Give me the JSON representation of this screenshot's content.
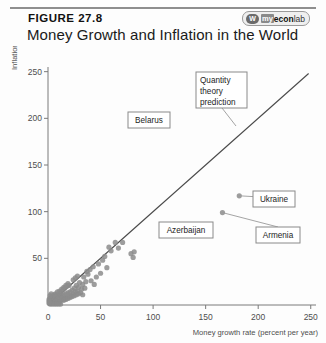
{
  "header": {
    "figure_label": "FIGURE 27.8",
    "title": "Money Growth and Inflation in the World",
    "logo": {
      "mark": "W",
      "part1": "my",
      "part2": "econ",
      "part3": "lab"
    }
  },
  "chart_data": {
    "type": "scatter",
    "title": "Money Growth and Inflation in the World",
    "xlabel": "Money growth rate (percent per year)",
    "ylabel": "Inflation rate (percent per year)",
    "xlim": [
      0,
      255
    ],
    "ylim": [
      0,
      255
    ],
    "xticks": [
      0,
      50,
      100,
      150,
      200,
      250
    ],
    "yticks": [
      50,
      100,
      150,
      200,
      250
    ],
    "grid": false,
    "legend": "none",
    "reference_line": {
      "name": "Quantity theory prediction",
      "slope": 1,
      "intercept": 0,
      "x_from": 0,
      "x_to": 248
    },
    "annotations": [
      {
        "label": "Belarus",
        "x": 96,
        "y": 193
      },
      {
        "label": "Quantity theory prediction",
        "x": 150,
        "y": 150
      },
      {
        "label": "Azerbaijan",
        "x": 117,
        "y": 85
      },
      {
        "label": "Ukraine",
        "x": 182,
        "y": 117
      },
      {
        "label": "Armenia",
        "x": 166,
        "y": 99
      }
    ],
    "points": [
      [
        96,
        193
      ],
      [
        117,
        85
      ],
      [
        182,
        117
      ],
      [
        166,
        99
      ],
      [
        64,
        67
      ],
      [
        71,
        67
      ],
      [
        79,
        55
      ],
      [
        82,
        57
      ],
      [
        81,
        51
      ],
      [
        56,
        40
      ],
      [
        50,
        34
      ],
      [
        46,
        30
      ],
      [
        41,
        26
      ],
      [
        44,
        22
      ],
      [
        36,
        25
      ],
      [
        35,
        18
      ],
      [
        34,
        30
      ],
      [
        33,
        22
      ],
      [
        32,
        17
      ],
      [
        30,
        24
      ],
      [
        29,
        19
      ],
      [
        28,
        15
      ],
      [
        27,
        21
      ],
      [
        26,
        14
      ],
      [
        25,
        18
      ],
      [
        24,
        12
      ],
      [
        23,
        16
      ],
      [
        22,
        10
      ],
      [
        21,
        14
      ],
      [
        20,
        9
      ],
      [
        19,
        13
      ],
      [
        18,
        8
      ],
      [
        17,
        12
      ],
      [
        16,
        7
      ],
      [
        15,
        11
      ],
      [
        14,
        6
      ],
      [
        13,
        10
      ],
      [
        12,
        5
      ],
      [
        11,
        9
      ],
      [
        10,
        4
      ],
      [
        9,
        8
      ],
      [
        8,
        3
      ],
      [
        7,
        7
      ],
      [
        6,
        2
      ],
      [
        5,
        6
      ],
      [
        4,
        2
      ],
      [
        3,
        5
      ],
      [
        2,
        1
      ],
      [
        1,
        4
      ],
      [
        12,
        13
      ],
      [
        14,
        16
      ],
      [
        10,
        11
      ],
      [
        8,
        9
      ],
      [
        6,
        7
      ],
      [
        16,
        18
      ],
      [
        18,
        20
      ],
      [
        20,
        21
      ],
      [
        13,
        7
      ],
      [
        11,
        3
      ],
      [
        9,
        2
      ],
      [
        7,
        4
      ],
      [
        5,
        3
      ],
      [
        4,
        6
      ],
      [
        3,
        2
      ],
      [
        15,
        5
      ],
      [
        17,
        6
      ],
      [
        19,
        7
      ],
      [
        21,
        8
      ],
      [
        23,
        9
      ],
      [
        25,
        10
      ],
      [
        27,
        11
      ],
      [
        29,
        12
      ],
      [
        31,
        13
      ],
      [
        33,
        11
      ],
      [
        12,
        1
      ],
      [
        10,
        1
      ],
      [
        8,
        1
      ],
      [
        6,
        1
      ],
      [
        4,
        1
      ],
      [
        2,
        3
      ],
      [
        3,
        8
      ],
      [
        5,
        10
      ],
      [
        7,
        12
      ],
      [
        9,
        14
      ],
      [
        11,
        15
      ],
      [
        13,
        17
      ],
      [
        15,
        19
      ],
      [
        6,
        11
      ],
      [
        4,
        9
      ],
      [
        2,
        7
      ],
      [
        1,
        2
      ],
      [
        1,
        6
      ],
      [
        2,
        10
      ],
      [
        3,
        12
      ],
      [
        24,
        27
      ],
      [
        26,
        29
      ],
      [
        28,
        31
      ],
      [
        19,
        23
      ],
      [
        17,
        21
      ],
      [
        40,
        38
      ],
      [
        43,
        41
      ],
      [
        38,
        33
      ],
      [
        37,
        36
      ],
      [
        48,
        44
      ],
      [
        58,
        62
      ],
      [
        60,
        58
      ],
      [
        52,
        48
      ],
      [
        54,
        52
      ],
      [
        67,
        61
      ]
    ]
  },
  "boxes": {
    "belarus": "Belarus",
    "quantity_theory": [
      "Quantity",
      "theory",
      "prediction"
    ],
    "azerbaijan": "Azerbaijan",
    "ukraine": "Ukraine",
    "armenia": "Armenia"
  },
  "colors": {
    "point": "#8c8c8c",
    "line": "#4a4a4a",
    "axis": "#7a7a7a",
    "box_border": "#8a8a8a",
    "text": "#1d1d1d"
  }
}
